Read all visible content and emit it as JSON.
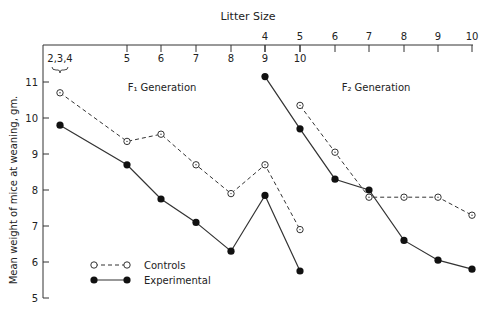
{
  "chart_data": {
    "type": "line",
    "title": "",
    "top_axis_label": "Litter Size",
    "ylabel": "Mean weight of mice at weaning, gm.",
    "ylim": [
      5,
      11
    ],
    "yticks": [
      5,
      6,
      7,
      8,
      9,
      10,
      11
    ],
    "grid": false,
    "legend_position": "lower-left",
    "legend": [
      {
        "name": "Controls",
        "style": "dashed, open circles"
      },
      {
        "name": "Experimental",
        "style": "solid, filled circles"
      }
    ],
    "panels": [
      {
        "name": "F1 Generation",
        "annotation": "F₁ Generation",
        "categories": [
          "2,3,4",
          "5",
          "6",
          "7",
          "8",
          "9",
          "10"
        ],
        "series": [
          {
            "name": "Controls",
            "values": [
              10.7,
              9.35,
              9.55,
              8.7,
              7.9,
              8.7,
              6.9
            ]
          },
          {
            "name": "Experimental",
            "values": [
              9.8,
              8.7,
              7.75,
              7.1,
              6.3,
              7.85,
              5.75
            ]
          }
        ]
      },
      {
        "name": "F2 Generation",
        "annotation": "F₂ Generation",
        "categories": [
          "4",
          "5",
          "6",
          "7",
          "8",
          "9",
          "10"
        ],
        "series": [
          {
            "name": "Controls",
            "values": [
              null,
              10.35,
              9.05,
              7.8,
              7.8,
              7.8,
              7.3
            ]
          },
          {
            "name": "Experimental",
            "values": [
              11.15,
              9.7,
              8.3,
              8.0,
              6.6,
              6.05,
              5.8
            ]
          }
        ]
      }
    ]
  },
  "labels": {
    "litter_size": "Litter Size",
    "f1": "F₁ Generation",
    "f2": "F₂ Generation",
    "ylabel": "Mean weight of mice at weaning, gm.",
    "legend_controls": "Controls",
    "legend_experimental": "Experimental"
  },
  "colors": {
    "ink": "#222222",
    "background": "#ffffff"
  }
}
